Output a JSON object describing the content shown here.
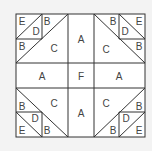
{
  "diagram": {
    "type": "quilt-block-pattern",
    "colors": {
      "background": "#f3f3f3",
      "block_fill": "#ffffff",
      "line": "#333333",
      "label": "#444444"
    },
    "labels": {
      "tl_E": "E",
      "tl_D": "D",
      "tl_B_top": "B",
      "tl_B_left": "B",
      "tl_C": "C",
      "tr_E": "E",
      "tr_D": "D",
      "tr_B_top": "B",
      "tr_B_right": "B",
      "tr_C": "C",
      "bl_E": "E",
      "bl_D": "D",
      "bl_B_bottom": "B",
      "bl_B_left": "B",
      "bl_C": "C",
      "br_E": "E",
      "br_D": "D",
      "br_B_bottom": "B",
      "br_B_right": "B",
      "br_C": "C",
      "top_A": "A",
      "left_A": "A",
      "center_F": "F",
      "right_A": "A",
      "bottom_A": "A"
    },
    "pieces": [
      "A",
      "B",
      "C",
      "D",
      "E",
      "F"
    ]
  }
}
